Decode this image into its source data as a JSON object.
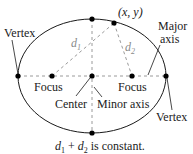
{
  "diagram": {
    "colors": {
      "curve": "#1a1a1a",
      "dashed": "#9a9a9a",
      "point": "#000000",
      "text": "#1a1a1a",
      "distance_label": "#8a8a8a"
    },
    "ellipse": {
      "cx": 92,
      "cy": 76,
      "rx": 74,
      "ry": 57
    },
    "points": {
      "left_vertex": [
        18,
        76
      ],
      "left_focus": [
        52,
        76
      ],
      "center": [
        92,
        76
      ],
      "right_focus": [
        132,
        76
      ],
      "right_vertex": [
        166,
        76
      ],
      "top_covertex": [
        92,
        19
      ],
      "bottom_covertex": [
        92,
        133
      ],
      "point_xy": [
        114,
        23
      ]
    },
    "labels": {
      "vertex_left": "Vertex",
      "vertex_right": "Vertex",
      "point": "(x, y)",
      "major_axis_line1": "Major",
      "major_axis_line2": "axis",
      "d1_base": "d",
      "d1_sub": "1",
      "d2_base": "d",
      "d2_sub": "2",
      "focus_left": "Focus",
      "focus_right": "Focus",
      "center": "Center",
      "minor_axis": "Minor axis",
      "caption_d1": "d",
      "caption_d1_sub": "1",
      "caption_plus": " + ",
      "caption_d2": "d",
      "caption_d2_sub": "2",
      "caption_rest": " is constant."
    }
  }
}
